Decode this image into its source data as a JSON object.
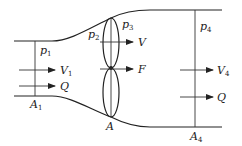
{
  "diagram": {
    "type": "actuator-disk-flow-tube",
    "labels": {
      "p1": {
        "main": "p",
        "sub": "1"
      },
      "p2": {
        "main": "p",
        "sub": "2"
      },
      "p3": {
        "main": "p",
        "sub": "3"
      },
      "p4": {
        "main": "p",
        "sub": "4"
      },
      "V1": {
        "main": "V",
        "sub": "1"
      },
      "V": {
        "main": "V",
        "sub": ""
      },
      "V4": {
        "main": "V",
        "sub": "4"
      },
      "F": {
        "main": "F",
        "sub": ""
      },
      "Q_in": {
        "main": "Q",
        "sub": ""
      },
      "Q_out": {
        "main": "Q",
        "sub": ""
      },
      "A1": {
        "main": "A",
        "sub": "1"
      },
      "A": {
        "main": "A",
        "sub": ""
      },
      "A4": {
        "main": "A",
        "sub": "4"
      }
    },
    "colors": {
      "stroke": "#222222",
      "background": "#ffffff"
    }
  }
}
